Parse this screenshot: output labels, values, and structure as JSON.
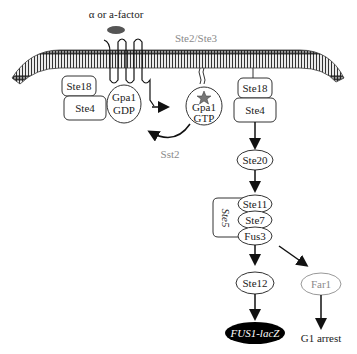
{
  "diagram": {
    "ligand": {
      "label": "α or a-factor",
      "color": "#555555"
    },
    "receptor": {
      "label": "Ste2/Ste3",
      "color": "#8a8a8a"
    },
    "left_gprotein": {
      "ste18": "Ste18",
      "ste4": "Ste4",
      "gpa1_line1": "Gpa1",
      "gpa1_line2": "GDP"
    },
    "right_gprotein": {
      "ste18": "Ste18",
      "ste4": "Ste4",
      "gpa1_line1": "Gpa1",
      "gpa1_line2": "GTP"
    },
    "sst2": {
      "label": "Sst2",
      "color": "#8a8a8a"
    },
    "ste20": "Ste20",
    "scaffold": {
      "label": "Ste5",
      "ste11": "Ste11",
      "ste7": "Ste7",
      "fus3": "Fus3"
    },
    "ste12": "Ste12",
    "reporter": {
      "label": "FUS1-lacZ",
      "bg": "#000000",
      "fg": "#ffffff"
    },
    "far1": {
      "label": "Far1",
      "color": "#8a8a8a"
    },
    "outcome": "G1 arrest"
  }
}
